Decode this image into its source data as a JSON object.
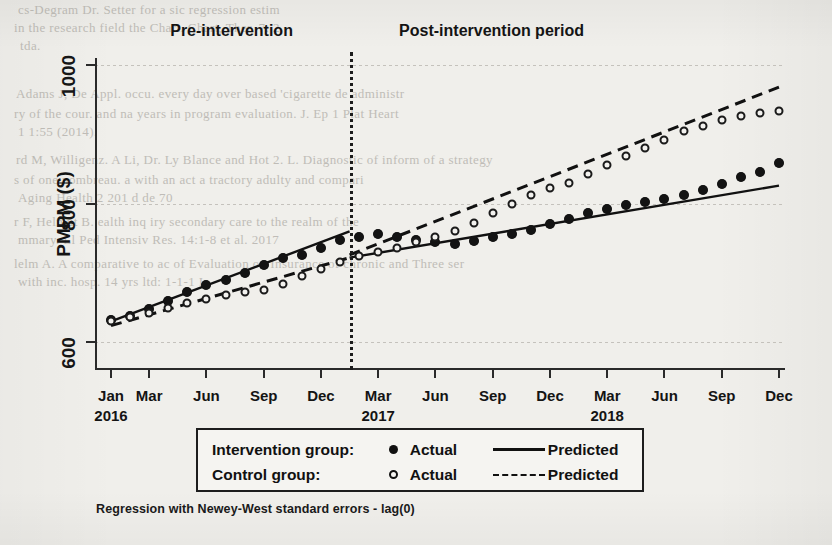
{
  "chart_data": {
    "type": "scatter",
    "title": "",
    "xlabel": "",
    "ylabel": "PMPM ($)",
    "ylim": [
      560,
      1010
    ],
    "yticks": [
      600,
      800,
      1000
    ],
    "grid": true,
    "x_tick_labels": [
      {
        "label": "Jan",
        "year": "2016",
        "index": 0
      },
      {
        "label": "Mar",
        "year": "",
        "index": 2
      },
      {
        "label": "Jun",
        "year": "",
        "index": 5
      },
      {
        "label": "Sep",
        "year": "",
        "index": 8
      },
      {
        "label": "Dec",
        "year": "",
        "index": 11
      },
      {
        "label": "Mar",
        "year": "2017",
        "index": 14
      },
      {
        "label": "Jun",
        "year": "",
        "index": 17
      },
      {
        "label": "Sep",
        "year": "",
        "index": 20
      },
      {
        "label": "Dec",
        "year": "",
        "index": 23
      },
      {
        "label": "Mar",
        "year": "2018",
        "index": 26
      },
      {
        "label": "Jun",
        "year": "",
        "index": 29
      },
      {
        "label": "Sep",
        "year": "",
        "index": 32
      },
      {
        "label": "Dec",
        "year": "",
        "index": 35
      }
    ],
    "x_index_range": [
      0,
      35
    ],
    "annotations": {
      "pre_label": "Pre-intervention",
      "post_label": "Post-intervention period",
      "divider_index": 12.5
    },
    "series": [
      {
        "name": "Intervention group: Actual",
        "marker": "filled-circle",
        "values": [
          632,
          638,
          648,
          660,
          672,
          682,
          690,
          700,
          712,
          722,
          726,
          736,
          748,
          752,
          756,
          752,
          748,
          744,
          742,
          746,
          752,
          756,
          762,
          770,
          778,
          786,
          792,
          798,
          802,
          806,
          812,
          820,
          828,
          838,
          846,
          858
        ]
      },
      {
        "name": "Control group: Actual",
        "marker": "open-circle",
        "values": [
          630,
          636,
          642,
          650,
          656,
          662,
          668,
          672,
          676,
          684,
          696,
          706,
          716,
          724,
          730,
          736,
          744,
          752,
          760,
          772,
          786,
          800,
          812,
          822,
          830,
          842,
          856,
          868,
          880,
          892,
          904,
          912,
          920,
          926,
          930,
          934
        ]
      },
      {
        "name": "Intervention group: Predicted",
        "line": "solid",
        "segments": [
          {
            "from_index": 0,
            "to_index": 12.5,
            "from_value": 630,
            "to_value": 760
          },
          {
            "from_index": 12.5,
            "to_index": 35,
            "from_value": 722,
            "to_value": 826
          }
        ]
      },
      {
        "name": "Control group: Predicted",
        "line": "dashed",
        "segments": [
          {
            "from_index": 0,
            "to_index": 12.5,
            "from_value": 624,
            "to_value": 722
          },
          {
            "from_index": 12.5,
            "to_index": 35,
            "from_value": 726,
            "to_value": 968
          }
        ]
      }
    ]
  },
  "legend": {
    "rows": [
      {
        "group": "Intervention group:",
        "marker": "filled-circle",
        "actual_label": "Actual",
        "line": "solid",
        "predicted_label": "Predicted"
      },
      {
        "group": "Control group:",
        "marker": "open-circle",
        "actual_label": "Actual",
        "line": "dashed",
        "predicted_label": "Predicted"
      }
    ]
  },
  "footnote": "Regression with Newey-West standard errors - lag(0)",
  "background_text": {
    "lines": [
      {
        "text": "cs-Degram Dr. Setter for a sic regression estim",
        "x": 18,
        "y": 2,
        "size": 13
      },
      {
        "text": "in the research field the Chart. Chart, Ther. 7: 2",
        "x": 14,
        "y": 20,
        "size": 13
      },
      {
        "text": "tda.",
        "x": 20,
        "y": 38,
        "size": 13
      },
      {
        "text": "Adams J, De Appl. occu. every day over based 'cigarette  de administr",
        "x": 16,
        "y": 86,
        "size": 13
      },
      {
        "text": "ry of the cour. and na years in program evaluation. J. Ep 1 Plat Heart",
        "x": 14,
        "y": 106,
        "size": 13
      },
      {
        "text": "1 1:55 (2014).",
        "x": 18,
        "y": 124,
        "size": 13
      },
      {
        "text": "rd M, Willigenz. A Li, Dr. Ly Blance and Hot 2. L. Diagnostic of inform of a strategy",
        "x": 16,
        "y": 152,
        "size": 13
      },
      {
        "text": "s of one nombreau. a with an act a tractory adulty and compari",
        "x": 14,
        "y": 172,
        "size": 13
      },
      {
        "text": "Aging Health 2 201 d de 70",
        "x": 18,
        "y": 190,
        "size": 13
      },
      {
        "text": "r F, Helmut B. ealth inq iry secondary care to the realm of the",
        "x": 14,
        "y": 214,
        "size": 13
      },
      {
        "text": "mmary. Ll Ped Intensiv Res. 14:1-8 et al. 2017",
        "x": 18,
        "y": 232,
        "size": 13
      },
      {
        "text": "lelm A. A comparative to ac of Evaluation on Insurance of chronic  and Three ser",
        "x": 14,
        "y": 256,
        "size": 13
      },
      {
        "text": "with inc. hosp. 14 yrs ltd: 1-1-1 I",
        "x": 18,
        "y": 274,
        "size": 13
      }
    ]
  }
}
